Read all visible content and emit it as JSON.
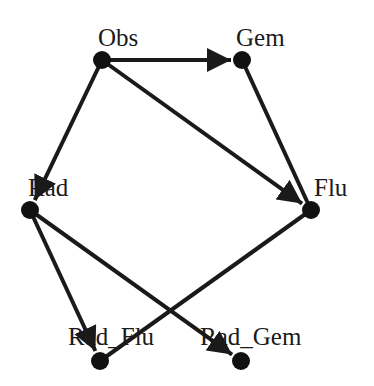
{
  "diagram": {
    "type": "directed-graph",
    "colors": {
      "edge": "#1a1a1a",
      "node": "#111111",
      "background": "#ffffff"
    },
    "nodes": [
      {
        "id": "Obs",
        "label": "Obs",
        "x": 102,
        "y": 60,
        "lx": 98,
        "ly": 46
      },
      {
        "id": "Gem",
        "label": "Gem",
        "x": 242,
        "y": 60,
        "lx": 236,
        "ly": 46
      },
      {
        "id": "Rad",
        "label": "Rad",
        "x": 30,
        "y": 210,
        "lx": 28,
        "ly": 196
      },
      {
        "id": "Flu",
        "label": "Flu",
        "x": 311,
        "y": 210,
        "lx": 314,
        "ly": 196
      },
      {
        "id": "Rad_Flu",
        "label": "Rad_Flu",
        "x": 100,
        "y": 361,
        "lx": 68,
        "ly": 345
      },
      {
        "id": "Rad_Gem",
        "label": "Rad_Gem",
        "x": 241,
        "y": 361,
        "lx": 200,
        "ly": 345
      }
    ],
    "edges": [
      {
        "from": "Obs",
        "to": "Gem",
        "directed": true
      },
      {
        "from": "Obs",
        "to": "Rad",
        "directed": true
      },
      {
        "from": "Obs",
        "to": "Flu",
        "directed": true
      },
      {
        "from": "Gem",
        "to": "Flu",
        "directed": false
      },
      {
        "from": "Rad",
        "to": "Rad_Flu",
        "directed": true
      },
      {
        "from": "Rad",
        "to": "Rad_Gem",
        "directed": true
      },
      {
        "from": "Flu",
        "to": "Rad_Flu",
        "directed": false
      }
    ]
  }
}
